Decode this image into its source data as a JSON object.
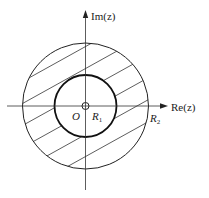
{
  "diagram": {
    "type": "annulus-region",
    "labels": {
      "imag_axis": "Im(z)",
      "real_axis": "Re(z)",
      "origin": "O",
      "inner_radius": "R",
      "inner_radius_sub": "1",
      "outer_radius": "R",
      "outer_radius_sub": "2"
    },
    "geometry": {
      "center": [
        85.5,
        106
      ],
      "outer_radius": 63,
      "inner_radius": 31,
      "origin_marker_radius": 3.5
    },
    "colors": {
      "stroke": "#222222",
      "background": "#ffffff"
    }
  }
}
